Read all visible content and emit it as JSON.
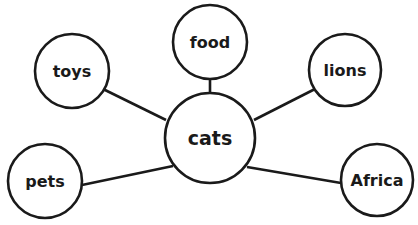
{
  "diagram": {
    "type": "concept-web",
    "center": {
      "label": "cats",
      "cx": 210,
      "cy": 138,
      "r": 45,
      "font_size": 19
    },
    "nodes": [
      {
        "id": "toys",
        "label": "toys",
        "cx": 72,
        "cy": 71,
        "r": 37,
        "font_size": 16
      },
      {
        "id": "food",
        "label": "food",
        "cx": 210,
        "cy": 42,
        "r": 37,
        "font_size": 16
      },
      {
        "id": "lions",
        "label": "lions",
        "cx": 345,
        "cy": 70,
        "r": 36,
        "font_size": 16
      },
      {
        "id": "pets",
        "label": "pets",
        "cx": 45,
        "cy": 181,
        "r": 37,
        "font_size": 16
      },
      {
        "id": "Africa",
        "label": "Africa",
        "cx": 377,
        "cy": 180,
        "r": 36,
        "font_size": 16
      }
    ],
    "edges": [
      {
        "from": "cats",
        "to": "toys",
        "x1": 166,
        "y1": 120,
        "x2": 103,
        "y2": 89
      },
      {
        "from": "cats",
        "to": "food",
        "x1": 210,
        "y1": 93,
        "x2": 210,
        "y2": 79
      },
      {
        "from": "cats",
        "to": "lions",
        "x1": 254,
        "y1": 120,
        "x2": 315,
        "y2": 89
      },
      {
        "from": "cats",
        "to": "pets",
        "x1": 173,
        "y1": 166,
        "x2": 82,
        "y2": 185
      },
      {
        "from": "cats",
        "to": "Africa",
        "x1": 247,
        "y1": 167,
        "x2": 341,
        "y2": 183
      }
    ],
    "stroke_color": "#1a1a1a",
    "fill_color": "#ffffff"
  }
}
